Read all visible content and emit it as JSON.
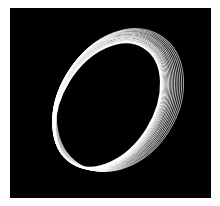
{
  "image": {
    "subject": "light-painting-ellipses",
    "background_color": "#000000",
    "frame_color": "#ffffff",
    "stroke_color": "#ffffff",
    "ring_count": 18
  }
}
